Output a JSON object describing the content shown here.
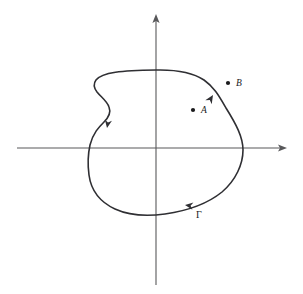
{
  "figure": {
    "background_color": "#ffffff",
    "width": 303,
    "height": 294
  },
  "axes": {
    "axis_color": "#58585a",
    "origin": {
      "x": 156,
      "y": 148
    },
    "x_axis": {
      "name": "x-axis",
      "start_x": 17,
      "end_x": 287,
      "y": 148,
      "arrow_at": "right"
    },
    "y_axis": {
      "name": "y-axis",
      "x": 156,
      "start_y": 285,
      "end_y": 14,
      "arrow_at": "top"
    }
  },
  "contour": {
    "name": "Gamma",
    "label": "Γ",
    "label_x": 196,
    "label_y": 218,
    "stroke_color": "#2f2f33",
    "stroke_width": 1.6,
    "closed": true,
    "orientation": "counterclockwise",
    "path": "M 156 70 C 176 69.5 192 72 204 80 C 214 87 219 96 226 108 C 236 124 243 137 243 150 C 243 164 236 180 222 192 C 206 205 186 211 165 214 C 146 216.5 128 215 115 209 C 100 202 91 190 89 175 C 87.5 164 88 154 90 145 C 93 133 99 127 104 122 C 109 117 111 112 109 107 C 107 101 101 97 97 92 C 94 88 93 84 96 80 C 102 72 122 70.5 156 70 Z",
    "direction_arrows": [
      {
        "name": "arrow-left-descending",
        "x": 107,
        "y": 128,
        "angle": 100
      },
      {
        "name": "arrow-bottom-leftward",
        "x": 185,
        "y": 205,
        "angle": 188
      },
      {
        "name": "arrow-right-ascending",
        "x": 213,
        "y": 95,
        "angle": 302
      }
    ]
  },
  "points": [
    {
      "name": "point-a",
      "label": "A",
      "dot_x": 193,
      "dot_y": 110,
      "label_x": 201,
      "label_y": 113,
      "position": "inside-contour"
    },
    {
      "name": "point-b",
      "label": "B",
      "dot_x": 228,
      "dot_y": 83,
      "label_x": 236,
      "label_y": 86,
      "position": "outside-contour"
    }
  ]
}
